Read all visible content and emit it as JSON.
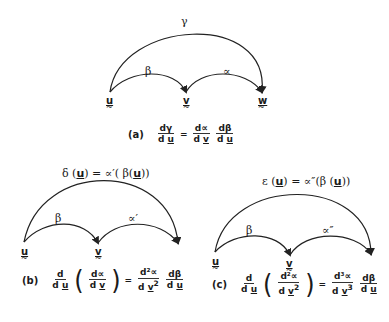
{
  "panel_a": {
    "nodes": {
      "u": "u",
      "v": "v",
      "w": "w"
    },
    "arrows": {
      "outer": "γ",
      "left": "β",
      "right": "∝"
    },
    "equation": {
      "tag": "(a)",
      "lhs": {
        "num": "dγ",
        "den_d": "d",
        "den_var": "u"
      },
      "eq": "=",
      "rhs1": {
        "num": "d∝",
        "den_d": "d",
        "den_var": "v"
      },
      "rhs2": {
        "num": "dβ",
        "den_d": "d",
        "den_var": "u"
      }
    }
  },
  "panel_b": {
    "title": {
      "pre": "δ (",
      "var": "u",
      "mid": ") = ∝′( β(",
      "var2": "u",
      "post": "))"
    },
    "nodes": {
      "u": "u",
      "v": "v"
    },
    "arrows": {
      "left": "β",
      "right": "∝′"
    },
    "equation": {
      "tag": "(b)",
      "lhs": {
        "num": "d",
        "den_d": "d",
        "den_var": "u"
      },
      "inner": {
        "num": "d∝",
        "den_d": "d",
        "den_var": "v"
      },
      "eq": "=",
      "rhs1": {
        "num": "d²∝",
        "den_d": "d",
        "den_var": "v",
        "den_pow": "2"
      },
      "rhs2": {
        "num": "dβ",
        "den_d": "d",
        "den_var": "u"
      }
    }
  },
  "panel_c": {
    "title": {
      "pre": "ε (",
      "var": "u",
      "mid": ") = ∝″(β (",
      "var2": "u",
      "post": "))"
    },
    "nodes": {
      "u": "u",
      "v": "v"
    },
    "arrows": {
      "left": "β",
      "right": "∝″"
    },
    "equation": {
      "tag": "(c)",
      "lhs": {
        "num": "d",
        "den_d": "d",
        "den_var": "u"
      },
      "inner": {
        "num": "d²∝",
        "den_d": "d",
        "den_var": "v",
        "den_pow": "2"
      },
      "eq": "=",
      "rhs1": {
        "num": "d³∝",
        "den_d": "d",
        "den_var": "v",
        "den_pow": "3"
      },
      "rhs2": {
        "num": "dβ",
        "den_d": "d",
        "den_var": "u"
      }
    }
  }
}
